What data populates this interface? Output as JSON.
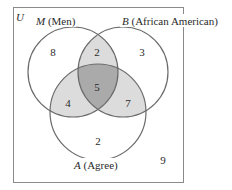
{
  "universe": {
    "label": "U"
  },
  "sets": {
    "M": {
      "letter": "M",
      "desc": "(Men)"
    },
    "B": {
      "letter": "B",
      "desc": "(African American)"
    },
    "A": {
      "letter": "A",
      "desc": "(Agree)"
    }
  },
  "regions": {
    "M_only": "8",
    "M_B_only": "2",
    "B_only": "3",
    "M_B_A": "5",
    "M_A_only": "4",
    "B_A_only": "7",
    "A_only": "2",
    "outside": "9"
  },
  "colors": {
    "stroke": "#6b6b6b",
    "shade_light": "#d9d9d9",
    "shade_dark": "#a8a8a8",
    "frame": "#8a8a8a"
  }
}
